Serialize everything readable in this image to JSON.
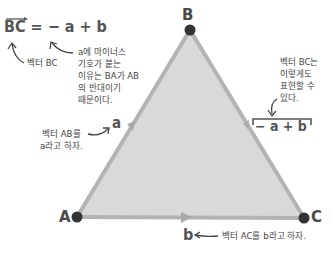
{
  "diagram": {
    "equation": {
      "lhs": "BC",
      "equals": "=",
      "rhs": "− a + b"
    },
    "vertices": [
      {
        "label": "A",
        "x": 77,
        "y": 217
      },
      {
        "label": "B",
        "x": 190,
        "y": 30
      },
      {
        "label": "C",
        "x": 304,
        "y": 218
      }
    ],
    "edge_labels": {
      "a": "a",
      "b": "b",
      "bc_expr": "− a + b"
    },
    "annotations": {
      "vector_bc": "벡터 BC",
      "minus_reason": [
        "a에 마이너스",
        "기호가 붙는",
        "이유는 BA가 AB",
        "의 반대이기",
        "때문이다."
      ],
      "bc_alt": [
        "벡터 BC는",
        "이렇게도",
        "표현할 수",
        "있다."
      ],
      "ab_def": [
        "벡터 AB를",
        "a라고 하자."
      ],
      "ac_def": "벡터 AC를 b라고 하자."
    },
    "colors": {
      "triangle_fill": "#d9d9d9",
      "edge": "#b3b3b3",
      "vertex_dot": "#333333",
      "text": "#444444"
    }
  }
}
